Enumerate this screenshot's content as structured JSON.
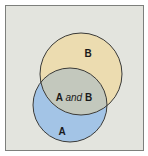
{
  "diagram": {
    "type": "venn",
    "sets": [
      {
        "id": "A",
        "label": "A",
        "color": "#a3c4e6",
        "cx": 70,
        "cy": 105,
        "r": 37
      },
      {
        "id": "B",
        "label": "B",
        "color": "#ecdcb0",
        "cx": 81,
        "cy": 74,
        "r": 41
      }
    ],
    "intersection": {
      "label_left": "A",
      "label_mid": "and",
      "label_right": "B",
      "color": "#c3c8bd"
    },
    "colors": {
      "background": "#e3e4de",
      "frame_border": "#7d7f7c",
      "circle_stroke": "#3a3a38"
    }
  }
}
